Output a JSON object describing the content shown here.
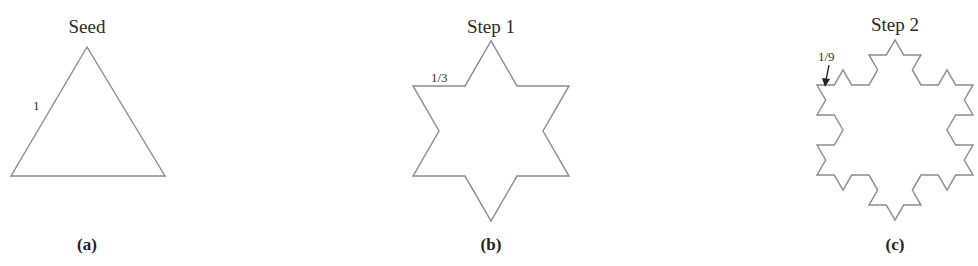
{
  "figure": {
    "panels": [
      {
        "id": "a",
        "title": "Seed",
        "caption": "(a)",
        "iteration": 0,
        "edge_label": "1",
        "edge_label_arrow": false
      },
      {
        "id": "b",
        "title": "Step 1",
        "caption": "(b)",
        "iteration": 1,
        "edge_label": "1/3",
        "edge_label_arrow": false
      },
      {
        "id": "c",
        "title": "Step 2",
        "caption": "(c)",
        "iteration": 2,
        "edge_label": "1/9",
        "edge_label_arrow": true
      }
    ],
    "colors": {
      "curve": "#8c8c8c",
      "text": "#222222",
      "background": "#ffffff"
    }
  }
}
